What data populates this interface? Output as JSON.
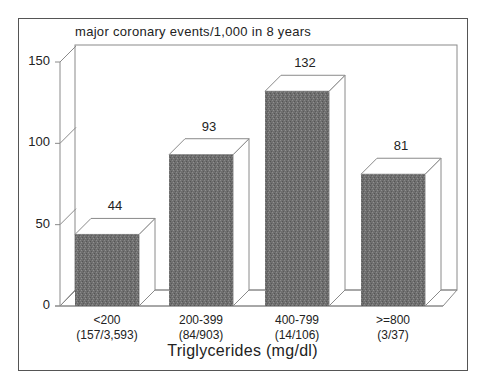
{
  "chart_data": {
    "type": "bar",
    "title": "major coronary events/1,000 in 8 years",
    "xlabel": "Triglycerides (mg/dl)",
    "ylabel": "",
    "ylim": [
      0,
      150
    ],
    "yticks": [
      0,
      50,
      100,
      150
    ],
    "categories": [
      "<200",
      "200-399",
      "400-799",
      ">=800"
    ],
    "category_sublabels": [
      "(157/3,593)",
      "(84/903)",
      "(14/106)",
      "(3/37)"
    ],
    "values": [
      44,
      93,
      132,
      81
    ],
    "data_labels": [
      "44",
      "93",
      "132",
      "81"
    ],
    "style": "3d",
    "grid": false,
    "legend": null
  },
  "colors": {
    "bar_fill": "#6e6e6e",
    "bar_side": "#ffffff",
    "line": "#8a8a8a",
    "border": "#555555"
  }
}
